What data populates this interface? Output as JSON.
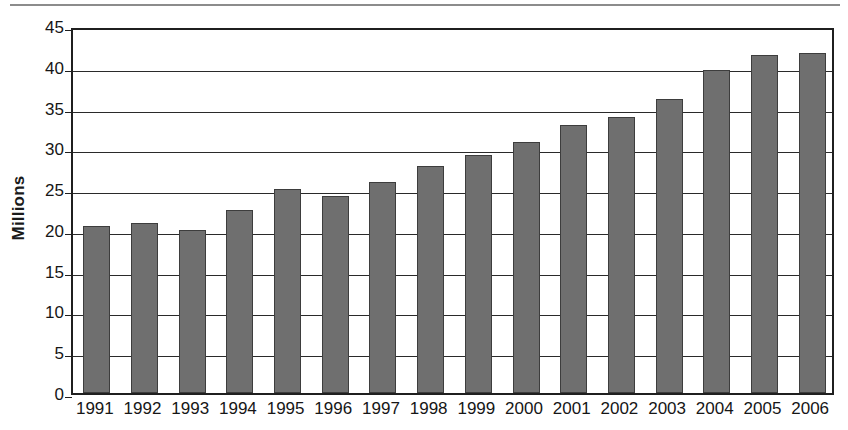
{
  "chart_data": {
    "type": "bar",
    "title": "",
    "xlabel": "",
    "ylabel": "Millions",
    "categories": [
      "1991",
      "1992",
      "1993",
      "1994",
      "1995",
      "1996",
      "1997",
      "1998",
      "1999",
      "2000",
      "2001",
      "2002",
      "2003",
      "2004",
      "2005",
      "2006"
    ],
    "values": [
      20.5,
      20.8,
      20.0,
      22.5,
      25.0,
      24.2,
      25.9,
      27.8,
      29.2,
      30.8,
      32.9,
      33.9,
      36.1,
      39.6,
      41.4,
      41.7
    ],
    "ylim": [
      0,
      45
    ],
    "yticks": [
      0,
      5,
      10,
      15,
      20,
      25,
      30,
      35,
      40,
      45
    ],
    "ytick_labels": [
      "0",
      "5",
      "10",
      "15",
      "20",
      "25",
      "30",
      "35",
      "40",
      "45"
    ],
    "grid": true,
    "grid_axis": "y",
    "legend": null,
    "legend_position": "none",
    "series": [
      {
        "name": "Millions",
        "color": "#6f6f6f",
        "values": [
          20.5,
          20.8,
          20.0,
          22.5,
          25.0,
          24.2,
          25.9,
          27.8,
          29.2,
          30.8,
          32.9,
          33.9,
          36.1,
          39.6,
          41.4,
          41.7
        ]
      }
    ]
  },
  "colors": {
    "bar_fill": "#6f6f6f",
    "bar_stroke": "#3d3d3d",
    "axis": "#1f1f1f",
    "grid": "#2a2a2a",
    "text": "#161616",
    "page_rule": "#8c8c8c",
    "background": "#ffffff"
  }
}
